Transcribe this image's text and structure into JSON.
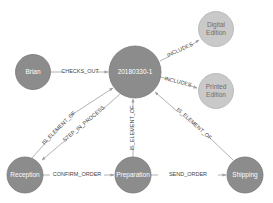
{
  "graph": {
    "colors": {
      "node_dark": "#8c8c8c",
      "node_dark_stroke": "#7a7a7a",
      "node_light": "#c9c9c9",
      "node_light_stroke": "#b3b3b3",
      "edge": "#a0a0a0",
      "background": "#ffffff"
    },
    "nodes": [
      {
        "id": "brian",
        "label": "Brian",
        "style": "dark"
      },
      {
        "id": "order",
        "label": "20180330-1",
        "style": "dark"
      },
      {
        "id": "digital",
        "label_lines": [
          "Digital",
          "Edition"
        ],
        "style": "light"
      },
      {
        "id": "printed",
        "label_lines": [
          "Printed",
          "Edition"
        ],
        "style": "light"
      },
      {
        "id": "reception",
        "label": "Reception",
        "style": "dark"
      },
      {
        "id": "preparation",
        "label": "Preparation",
        "style": "dark"
      },
      {
        "id": "shipping",
        "label": "Shipping",
        "style": "dark"
      }
    ],
    "edges": [
      {
        "from": "brian",
        "to": "order",
        "label": "CHECKS_OUT"
      },
      {
        "from": "order",
        "to": "digital",
        "label": "INCLUDES"
      },
      {
        "from": "order",
        "to": "printed",
        "label": "INCLUDES"
      },
      {
        "from": "reception",
        "to": "order",
        "label": "IS_ELEMENT_OF"
      },
      {
        "from": "order",
        "to": "reception",
        "label": "STEP_IN_PROCESS"
      },
      {
        "from": "preparation",
        "to": "order",
        "label": "IS_ELEMENT_OF"
      },
      {
        "from": "shipping",
        "to": "order",
        "label": "IS_ELEMENT_OF"
      },
      {
        "from": "reception",
        "to": "preparation",
        "label": "CONFIRM_ORDER"
      },
      {
        "from": "preparation",
        "to": "shipping",
        "label": "SEND_ORDER"
      }
    ]
  }
}
